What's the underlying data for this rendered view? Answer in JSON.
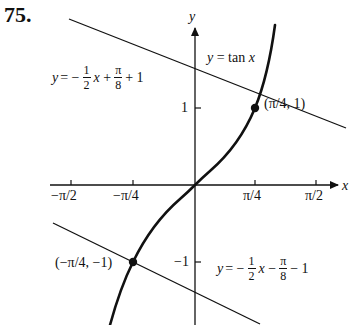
{
  "problem": {
    "number": "75."
  },
  "axes": {
    "x_label": "x",
    "y_label": "y",
    "x_ticks": [
      "−π/2",
      "−π/4",
      "π/4",
      "π/2"
    ],
    "y_ticks": [
      "1",
      "−1"
    ]
  },
  "labels": {
    "tan_curve": "y = tan x",
    "point_upper": "(π/4, 1)",
    "point_lower": "(−π/4, −1)",
    "line_upper": {
      "lhs": "y = −",
      "frac1_num": "1",
      "frac1_den": "2",
      "mid": "x +",
      "frac2_num": "π",
      "frac2_den": "8",
      "rhs": "+ 1"
    },
    "line_lower": {
      "lhs": "y = −",
      "frac1_num": "1",
      "frac1_den": "2",
      "mid": "x −",
      "frac2_num": "π",
      "frac2_den": "8",
      "rhs": "− 1"
    }
  },
  "colors": {
    "ink": "#111111",
    "background": "#ffffff"
  },
  "chart_data": {
    "type": "line",
    "title": "",
    "xlabel": "x",
    "ylabel": "y",
    "xlim": [
      -1.9,
      2.1
    ],
    "ylim": [
      -1.8,
      2.4
    ],
    "grid": false,
    "x_tick_labels": [
      "−π/2",
      "−π/4",
      "π/4",
      "π/2"
    ],
    "x_tick_values": [
      -1.5708,
      -0.7854,
      0.7854,
      1.5708
    ],
    "y_tick_labels": [
      "1",
      "−1"
    ],
    "y_tick_values": [
      1,
      -1
    ],
    "series": [
      {
        "name": "y = tan x",
        "function": "tan(x)",
        "x_range": [
          -1.1,
          1.05
        ],
        "style": "thick"
      },
      {
        "name": "y = −(1/2)x + π/8 + 1",
        "function": "-0.5*x + 0.3927 + 1",
        "x_range": [
          -1.6,
          2.0
        ],
        "style": "thin"
      },
      {
        "name": "y = −(1/2)x − π/8 − 1",
        "function": "-0.5*x - 0.3927 - 1",
        "x_range": [
          -1.6,
          1.1
        ],
        "style": "thin"
      }
    ],
    "points": [
      {
        "label": "(π/4, 1)",
        "x": 0.7854,
        "y": 1
      },
      {
        "label": "(−π/4, −1)",
        "x": -0.7854,
        "y": -1
      }
    ],
    "annotations": [
      "y = tan x",
      "y = −(1/2)x + π/8 + 1",
      "y = −(1/2)x − π/8 − 1",
      "(π/4, 1)",
      "(−π/4, −1)"
    ]
  }
}
